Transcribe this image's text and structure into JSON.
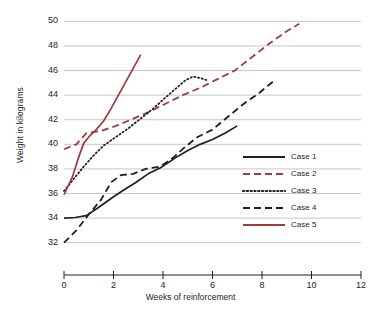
{
  "chart_data": {
    "type": "line",
    "title": "",
    "xlabel": "Weeks of reinforcement",
    "ylabel": "Weight in kilograms",
    "xlim": [
      0,
      12
    ],
    "ylim": [
      31,
      50.6
    ],
    "xticks": [
      0,
      2,
      4,
      6,
      8,
      10,
      12
    ],
    "yticks": [
      32,
      34,
      36,
      38,
      40,
      42,
      44,
      46,
      48,
      50
    ],
    "grid": "horizontal",
    "legend_position": "center-right",
    "series": [
      {
        "name": "Case 1",
        "style": "solid",
        "color": "#231f20",
        "points": [
          [
            0,
            34.0
          ],
          [
            0.45,
            34.05
          ],
          [
            0.9,
            34.2
          ],
          [
            1.35,
            34.8
          ],
          [
            1.9,
            35.6
          ],
          [
            2.35,
            36.2
          ],
          [
            2.9,
            36.9
          ],
          [
            3.4,
            37.6
          ],
          [
            3.9,
            38.1
          ],
          [
            4.5,
            38.9
          ],
          [
            5.0,
            39.5
          ],
          [
            5.5,
            40.0
          ],
          [
            6.0,
            40.4
          ],
          [
            6.5,
            40.9
          ],
          [
            7.0,
            41.5
          ]
        ]
      },
      {
        "name": "Case 2",
        "style": "dashed",
        "color": "#a03a3c",
        "points": [
          [
            0,
            39.6
          ],
          [
            0.5,
            40.0
          ],
          [
            0.9,
            40.9
          ],
          [
            1.5,
            41.1
          ],
          [
            2.1,
            41.5
          ],
          [
            2.7,
            42.0
          ],
          [
            3.4,
            42.6
          ],
          [
            4.1,
            43.3
          ],
          [
            4.8,
            44.0
          ],
          [
            5.5,
            44.6
          ],
          [
            6.2,
            45.3
          ],
          [
            6.9,
            46.0
          ],
          [
            7.6,
            47.1
          ],
          [
            8.3,
            48.2
          ],
          [
            9.0,
            49.2
          ],
          [
            9.5,
            49.8
          ]
        ]
      },
      {
        "name": "Case 3",
        "style": "dotted",
        "color": "#231f20",
        "points": [
          [
            0,
            36.2
          ],
          [
            0.4,
            37.2
          ],
          [
            0.8,
            38.2
          ],
          [
            1.2,
            39.1
          ],
          [
            1.6,
            39.9
          ],
          [
            2.1,
            40.6
          ],
          [
            2.6,
            41.3
          ],
          [
            3.1,
            42.1
          ],
          [
            3.6,
            42.9
          ],
          [
            4.1,
            43.8
          ],
          [
            4.5,
            44.5
          ],
          [
            4.9,
            45.2
          ],
          [
            5.2,
            45.5
          ],
          [
            5.5,
            45.4
          ],
          [
            5.8,
            45.2
          ]
        ]
      },
      {
        "name": "Case 4",
        "style": "dashed",
        "color": "#231f20",
        "points": [
          [
            0,
            32.0
          ],
          [
            0.5,
            33.0
          ],
          [
            1.0,
            34.3
          ],
          [
            1.5,
            35.5
          ],
          [
            1.9,
            36.9
          ],
          [
            2.3,
            37.5
          ],
          [
            2.8,
            37.6
          ],
          [
            3.3,
            38.0
          ],
          [
            3.9,
            38.2
          ],
          [
            4.4,
            38.9
          ],
          [
            4.9,
            39.8
          ],
          [
            5.4,
            40.6
          ],
          [
            6.0,
            41.2
          ],
          [
            6.6,
            42.2
          ],
          [
            7.2,
            43.2
          ],
          [
            7.9,
            44.2
          ],
          [
            8.5,
            45.2
          ]
        ]
      },
      {
        "name": "Case 5",
        "style": "solid",
        "color": "#a03a3c",
        "points": [
          [
            0,
            35.9
          ],
          [
            0.35,
            37.4
          ],
          [
            0.6,
            39.0
          ],
          [
            0.8,
            40.1
          ],
          [
            1.0,
            40.6
          ],
          [
            1.3,
            41.2
          ],
          [
            1.6,
            41.9
          ],
          [
            1.9,
            42.9
          ],
          [
            2.2,
            44.0
          ],
          [
            2.5,
            45.1
          ],
          [
            2.8,
            46.2
          ],
          [
            3.1,
            47.3
          ]
        ]
      }
    ]
  },
  "legend": {
    "items": [
      {
        "label": "Case 1"
      },
      {
        "label": "Case 2"
      },
      {
        "label": "Case 3"
      },
      {
        "label": "Case 4"
      },
      {
        "label": "Case 5"
      }
    ]
  },
  "axis": {
    "y_title": "Weight in kilograms",
    "x_title": "Weeks of reinforcement",
    "y_tick_labels": [
      "50",
      "48",
      "46",
      "44",
      "42",
      "40",
      "38",
      "36",
      "34",
      "32"
    ],
    "x_tick_labels": [
      "0",
      "2",
      "4",
      "6",
      "8",
      "10",
      "12"
    ]
  },
  "colors": {
    "ink": "#231f20",
    "red": "#a03a3c",
    "grid": "#b8b8b8",
    "background": "#ffffff"
  }
}
